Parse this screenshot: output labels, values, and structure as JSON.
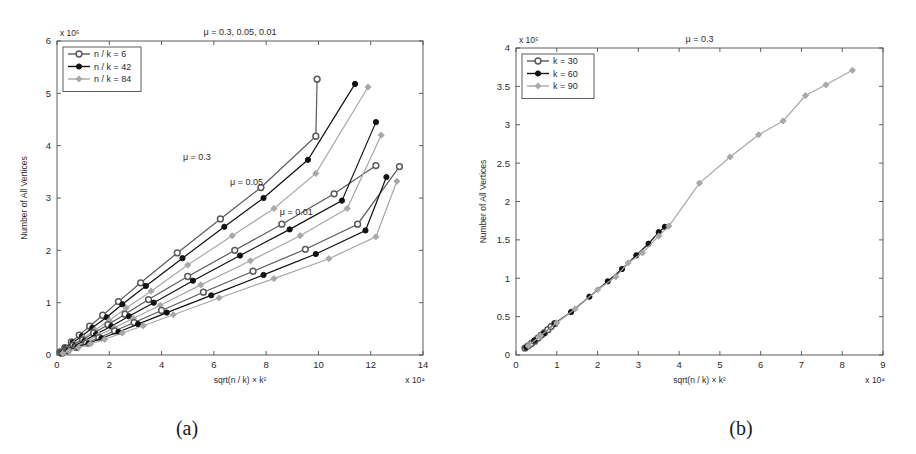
{
  "figure": {
    "caption_a": "(a)",
    "caption_b": "(b)"
  },
  "chart_data": [
    {
      "type": "line",
      "panel": "a",
      "title": "μ = 0.3, 0.05, 0.01",
      "xlabel": "sqrt(n / k) × k²",
      "ylabel": "Number of All Vertices",
      "x_exponent": "x 10⁴",
      "y_exponent": "x 10⁵",
      "xlim": [
        0,
        14
      ],
      "ylim": [
        0,
        6
      ],
      "xticks": [
        0,
        2,
        4,
        6,
        8,
        10,
        12,
        14
      ],
      "yticks": [
        0,
        1,
        2,
        3,
        4,
        5,
        6
      ],
      "grid": false,
      "legend_position": "top-left",
      "legend": [
        "n / k = 6",
        "n / k = 42",
        "n / k = 84"
      ],
      "annotations": [
        {
          "text": "μ = 0.3",
          "x": 5.35,
          "y": 3.73
        },
        {
          "text": "μ = 0.05",
          "x": 7.25,
          "y": 3.24
        },
        {
          "text": "μ = 0.01",
          "x": 9.15,
          "y": 2.67
        }
      ],
      "series": [
        {
          "name": "n / k = 6",
          "group": "μ = 0.3",
          "color": "#5a5a5a",
          "marker": "circle-open",
          "x": [
            0.18,
            0.42,
            0.78,
            1.22,
            1.72,
            2.3,
            3.15,
            4.62,
            6.22,
            7.85,
            9.88
          ],
          "y": [
            0.1,
            0.2,
            0.33,
            0.49,
            0.71,
            0.95,
            1.3,
            1.92,
            2.48,
            3.15,
            3.65,
            4.18,
            5.27
          ]
        },
        {
          "name": "n / k = 42",
          "group": "μ = 0.3",
          "color": "#111111",
          "marker": "circle-filled",
          "x": [
            0.22,
            0.5,
            0.9,
            1.4,
            1.95,
            2.6,
            3.5,
            5.0,
            6.7,
            8.5,
            10.6,
            12.1
          ],
          "y": [
            0.09,
            0.18,
            0.3,
            0.45,
            0.65,
            0.88,
            1.2,
            1.78,
            2.35,
            3.1,
            3.73,
            4.45
          ]
        },
        {
          "name": "n / k = 84",
          "group": "μ = 0.3",
          "color": "#a8a8a8",
          "marker": "diamond",
          "x": [
            0.25,
            0.55,
            1.0,
            1.5,
            2.1,
            2.8,
            3.8,
            5.4,
            7.2,
            9.1,
            11.2
          ],
          "y": [
            0.08,
            0.17,
            0.28,
            0.42,
            0.6,
            0.82,
            1.12,
            1.65,
            2.2,
            2.9,
            3.5
          ]
        }
      ],
      "groups": [
        {
          "label": "μ = 0.3",
          "curves": [
            {
              "name": "n / k = 6",
              "color": "#5a5a5a",
              "marker": "circle-open",
              "points": [
                [
                  0.12,
                  0.06
                ],
                [
                  0.3,
                  0.14
                ],
                [
                  0.55,
                  0.25
                ],
                [
                  0.85,
                  0.38
                ],
                [
                  1.25,
                  0.55
                ],
                [
                  1.75,
                  0.76
                ],
                [
                  2.35,
                  1.02
                ],
                [
                  3.2,
                  1.38
                ],
                [
                  4.6,
                  1.95
                ],
                [
                  6.25,
                  2.6
                ],
                [
                  7.8,
                  3.2
                ],
                [
                  9.9,
                  4.18
                ],
                [
                  9.95,
                  5.27
                ]
              ]
            },
            {
              "name": "n / k = 42",
              "color": "#111111",
              "marker": "circle-filled",
              "points": [
                [
                  0.14,
                  0.055
                ],
                [
                  0.33,
                  0.13
                ],
                [
                  0.6,
                  0.24
                ],
                [
                  0.95,
                  0.36
                ],
                [
                  1.35,
                  0.52
                ],
                [
                  1.9,
                  0.72
                ],
                [
                  2.5,
                  0.97
                ],
                [
                  3.4,
                  1.32
                ],
                [
                  4.8,
                  1.85
                ],
                [
                  6.4,
                  2.45
                ],
                [
                  7.9,
                  3.0
                ],
                [
                  9.6,
                  3.73
                ],
                [
                  11.4,
                  5.18
                ]
              ]
            },
            {
              "name": "n / k = 84",
              "color": "#a8a8a8",
              "marker": "diamond",
              "points": [
                [
                  0.16,
                  0.05
                ],
                [
                  0.36,
                  0.12
                ],
                [
                  0.66,
                  0.22
                ],
                [
                  1.02,
                  0.33
                ],
                [
                  1.45,
                  0.48
                ],
                [
                  2.0,
                  0.66
                ],
                [
                  2.65,
                  0.9
                ],
                [
                  3.6,
                  1.22
                ],
                [
                  5.0,
                  1.72
                ],
                [
                  6.7,
                  2.28
                ],
                [
                  8.3,
                  2.8
                ],
                [
                  9.9,
                  3.47
                ],
                [
                  11.9,
                  5.12
                ]
              ]
            }
          ]
        },
        {
          "label": "μ = 0.05",
          "curves": [
            {
              "name": "n / k = 6",
              "color": "#5a5a5a",
              "marker": "circle-open",
              "points": [
                [
                  0.15,
                  0.045
                ],
                [
                  0.35,
                  0.1
                ],
                [
                  0.62,
                  0.19
                ],
                [
                  0.98,
                  0.29
                ],
                [
                  1.4,
                  0.42
                ],
                [
                  1.95,
                  0.58
                ],
                [
                  2.6,
                  0.78
                ],
                [
                  3.5,
                  1.06
                ],
                [
                  5.0,
                  1.5
                ],
                [
                  6.8,
                  2.0
                ],
                [
                  8.6,
                  2.5
                ],
                [
                  10.6,
                  3.08
                ],
                [
                  12.2,
                  3.62
                ]
              ]
            },
            {
              "name": "n / k = 42",
              "color": "#111111",
              "marker": "circle-filled",
              "points": [
                [
                  0.17,
                  0.042
                ],
                [
                  0.38,
                  0.095
                ],
                [
                  0.68,
                  0.18
                ],
                [
                  1.05,
                  0.27
                ],
                [
                  1.5,
                  0.4
                ],
                [
                  2.08,
                  0.55
                ],
                [
                  2.75,
                  0.74
                ],
                [
                  3.7,
                  1.0
                ],
                [
                  5.2,
                  1.42
                ],
                [
                  7.0,
                  1.9
                ],
                [
                  8.9,
                  2.4
                ],
                [
                  10.9,
                  2.95
                ],
                [
                  12.2,
                  4.45
                ]
              ]
            },
            {
              "name": "n / k = 84",
              "color": "#a8a8a8",
              "marker": "diamond",
              "points": [
                [
                  0.19,
                  0.04
                ],
                [
                  0.42,
                  0.09
                ],
                [
                  0.74,
                  0.17
                ],
                [
                  1.12,
                  0.26
                ],
                [
                  1.6,
                  0.38
                ],
                [
                  2.2,
                  0.52
                ],
                [
                  2.92,
                  0.7
                ],
                [
                  3.95,
                  0.95
                ],
                [
                  5.5,
                  1.34
                ],
                [
                  7.4,
                  1.8
                ],
                [
                  9.3,
                  2.28
                ],
                [
                  11.1,
                  2.8
                ],
                [
                  12.4,
                  4.2
                ]
              ]
            }
          ]
        },
        {
          "label": "μ = 0.01",
          "curves": [
            {
              "name": "n / k = 6",
              "color": "#5a5a5a",
              "marker": "circle-open",
              "points": [
                [
                  0.18,
                  0.035
                ],
                [
                  0.4,
                  0.08
                ],
                [
                  0.72,
                  0.15
                ],
                [
                  1.12,
                  0.23
                ],
                [
                  1.6,
                  0.33
                ],
                [
                  2.2,
                  0.46
                ],
                [
                  2.95,
                  0.62
                ],
                [
                  4.0,
                  0.85
                ],
                [
                  5.6,
                  1.2
                ],
                [
                  7.5,
                  1.6
                ],
                [
                  9.5,
                  2.02
                ],
                [
                  11.5,
                  2.5
                ],
                [
                  13.1,
                  3.6
                ]
              ]
            },
            {
              "name": "n / k = 42",
              "color": "#111111",
              "marker": "circle-filled",
              "points": [
                [
                  0.2,
                  0.033
                ],
                [
                  0.43,
                  0.077
                ],
                [
                  0.77,
                  0.145
                ],
                [
                  1.2,
                  0.22
                ],
                [
                  1.7,
                  0.32
                ],
                [
                  2.35,
                  0.44
                ],
                [
                  3.1,
                  0.59
                ],
                [
                  4.2,
                  0.81
                ],
                [
                  5.9,
                  1.14
                ],
                [
                  7.9,
                  1.53
                ],
                [
                  9.9,
                  1.93
                ],
                [
                  11.8,
                  2.38
                ],
                [
                  12.6,
                  3.4
                ]
              ]
            },
            {
              "name": "n / k = 84",
              "color": "#a8a8a8",
              "marker": "diamond",
              "points": [
                [
                  0.22,
                  0.031
                ],
                [
                  0.46,
                  0.073
                ],
                [
                  0.82,
                  0.14
                ],
                [
                  1.28,
                  0.21
                ],
                [
                  1.82,
                  0.3
                ],
                [
                  2.5,
                  0.42
                ],
                [
                  3.3,
                  0.56
                ],
                [
                  4.45,
                  0.77
                ],
                [
                  6.2,
                  1.09
                ],
                [
                  8.3,
                  1.46
                ],
                [
                  10.4,
                  1.84
                ],
                [
                  12.2,
                  2.26
                ],
                [
                  13.0,
                  3.32
                ]
              ]
            }
          ]
        }
      ]
    },
    {
      "type": "line",
      "panel": "b",
      "title": "μ = 0.3",
      "xlabel": "sqrt(n / k) × k²",
      "ylabel": "Number of All Vertices",
      "x_exponent": "x 10⁴",
      "y_exponent": "x 10⁵",
      "xlim": [
        0,
        9
      ],
      "ylim": [
        0,
        4
      ],
      "xticks": [
        0,
        1,
        2,
        3,
        4,
        5,
        6,
        7,
        8,
        9
      ],
      "yticks": [
        0,
        0.5,
        1,
        1.5,
        2,
        2.5,
        3,
        3.5,
        4
      ],
      "grid": false,
      "legend_position": "top-left",
      "legend": [
        "k = 30",
        "k = 60",
        "k = 90"
      ],
      "annotations": [],
      "groups": [
        {
          "label": "k = 30",
          "curves": [
            {
              "name": "k = 30",
              "color": "#5a5a5a",
              "marker": "circle-open",
              "points": [
                [
                  0.22,
                  0.09
                ],
                [
                  0.3,
                  0.12
                ],
                [
                  0.38,
                  0.15
                ],
                [
                  0.46,
                  0.18
                ],
                [
                  0.54,
                  0.22
                ],
                [
                  0.62,
                  0.26
                ],
                [
                  0.7,
                  0.29
                ],
                [
                  0.78,
                  0.33
                ],
                [
                  0.86,
                  0.37
                ],
                [
                  0.95,
                  0.41
                ]
              ]
            }
          ]
        },
        {
          "label": "k = 60",
          "curves": [
            {
              "name": "k = 60",
              "color": "#111111",
              "marker": "circle-filled",
              "points": [
                [
                  0.25,
                  0.1
                ],
                [
                  0.45,
                  0.19
                ],
                [
                  0.68,
                  0.28
                ],
                [
                  0.95,
                  0.41
                ],
                [
                  1.35,
                  0.56
                ],
                [
                  1.8,
                  0.76
                ],
                [
                  2.25,
                  0.96
                ],
                [
                  2.6,
                  1.12
                ],
                [
                  2.95,
                  1.3
                ],
                [
                  3.25,
                  1.45
                ],
                [
                  3.5,
                  1.6
                ],
                [
                  3.65,
                  1.67
                ]
              ]
            }
          ]
        },
        {
          "label": "k = 90",
          "curves": [
            {
              "name": "k = 90",
              "color": "#a8a8a8",
              "marker": "diamond",
              "points": [
                [
                  0.3,
                  0.12
                ],
                [
                  0.6,
                  0.25
                ],
                [
                  1.0,
                  0.42
                ],
                [
                  1.45,
                  0.6
                ],
                [
                  2.0,
                  0.85
                ],
                [
                  2.45,
                  1.02
                ],
                [
                  2.75,
                  1.2
                ],
                [
                  3.1,
                  1.33
                ],
                [
                  3.5,
                  1.55
                ],
                [
                  3.75,
                  1.68
                ],
                [
                  4.5,
                  2.24
                ],
                [
                  5.25,
                  2.58
                ],
                [
                  5.95,
                  2.87
                ],
                [
                  6.55,
                  3.05
                ],
                [
                  7.1,
                  3.38
                ],
                [
                  7.6,
                  3.52
                ],
                [
                  8.25,
                  3.71
                ]
              ]
            }
          ]
        }
      ]
    }
  ]
}
